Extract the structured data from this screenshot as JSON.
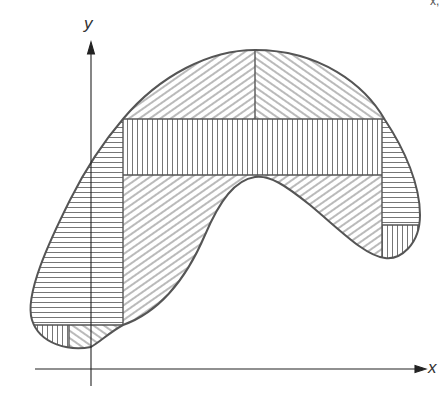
{
  "figure": {
    "type": "region decomposition diagram",
    "axes": {
      "x_label": "x",
      "y_label": "y"
    },
    "corner_fragment": "x,",
    "colors": {
      "outline": "#555555",
      "hatch": "#666666",
      "axis": "#222222",
      "background": "#ffffff"
    },
    "regions": [
      {
        "id": "top-left-cap",
        "hatch": "diagonal-up"
      },
      {
        "id": "top-right-cap",
        "hatch": "diagonal-down"
      },
      {
        "id": "central-band",
        "hatch": "vertical"
      },
      {
        "id": "left-strip",
        "hatch": "horizontal"
      },
      {
        "id": "lower-middle",
        "hatch": "diagonal-up"
      },
      {
        "id": "right-upper",
        "hatch": "horizontal"
      },
      {
        "id": "right-lower",
        "hatch": "vertical"
      },
      {
        "id": "bottom-left-small",
        "hatch": "vertical"
      },
      {
        "id": "bottom-right-small",
        "hatch": "diagonal-down"
      }
    ]
  }
}
